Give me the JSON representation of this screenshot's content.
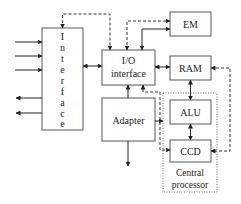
{
  "diagram": {
    "type": "block-diagram",
    "colors": {
      "stroke": "#555555",
      "text": "#222222",
      "background": "#ffffff"
    },
    "blocks": {
      "interface": {
        "letters": [
          "I",
          "n",
          "t",
          "e",
          "r",
          "f",
          "a",
          "c",
          "e"
        ]
      },
      "io_interface": {
        "line1": "I/O",
        "line2": "interface"
      },
      "em": {
        "label": "EM"
      },
      "ram": {
        "label": "RAM"
      },
      "alu": {
        "label": "ALU"
      },
      "ccd": {
        "label": "CCD"
      },
      "adapter": {
        "label": "Adapter"
      },
      "central_processor": {
        "line1": "Central",
        "line2": "processor"
      }
    },
    "connections": [
      {
        "from": "external",
        "to": "interface",
        "count": 3,
        "style": "solid",
        "direction": "in"
      },
      {
        "from": "interface",
        "to": "external",
        "count": 2,
        "style": "solid",
        "direction": "out"
      },
      {
        "from": "interface",
        "to": "io_interface",
        "style": "solid",
        "direction": "bidirectional"
      },
      {
        "from": "io_interface",
        "to": "interface",
        "style": "dashed",
        "direction": "bidirectional"
      },
      {
        "from": "io_interface",
        "to": "em",
        "style": "dashed",
        "direction": "to-em"
      },
      {
        "from": "io_interface",
        "to": "em",
        "style": "solid",
        "direction": "bidirectional"
      },
      {
        "from": "io_interface",
        "to": "ram",
        "style": "solid",
        "direction": "bidirectional"
      },
      {
        "from": "ram",
        "to": "alu",
        "style": "solid",
        "direction": "bidirectional"
      },
      {
        "from": "alu",
        "to": "ccd",
        "style": "solid",
        "direction": "bidirectional"
      },
      {
        "from": "ram",
        "to": "ccd",
        "style": "dashed",
        "direction": "bidirectional"
      },
      {
        "from": "adapter",
        "to": "io_interface",
        "style": "solid",
        "direction": "up"
      },
      {
        "from": "adapter",
        "to": "external",
        "style": "solid",
        "direction": "down"
      },
      {
        "from": "adapter",
        "to": "ccd",
        "style": "solid",
        "direction": "right"
      },
      {
        "from": "ccd",
        "to": "io_interface",
        "style": "dashed",
        "direction": "bidirectional"
      }
    ]
  }
}
